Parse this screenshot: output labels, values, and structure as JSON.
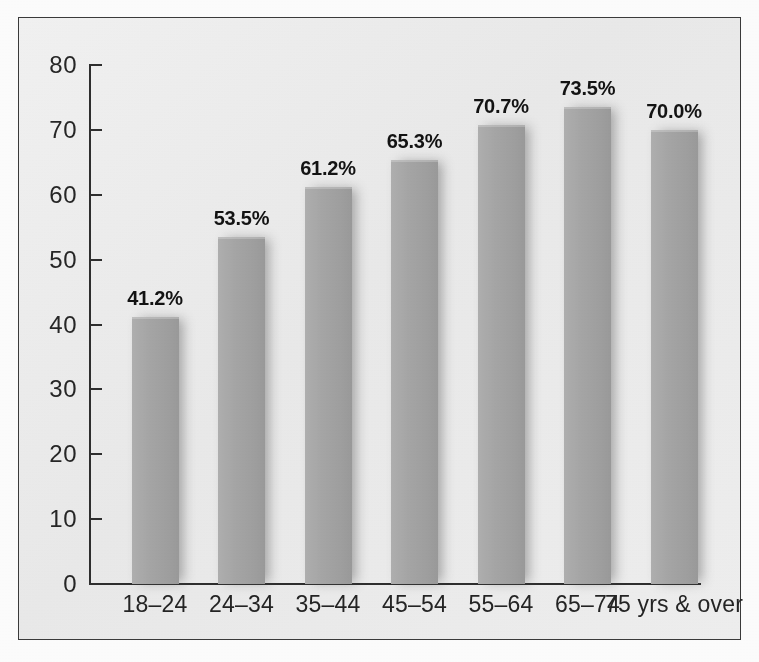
{
  "chart_data": {
    "type": "bar",
    "title": "",
    "subtitle": "",
    "xlabel": "",
    "ylabel": "",
    "categories": [
      "18–24",
      "24–34",
      "35–44",
      "45–54",
      "55–64",
      "65–74",
      "75 yrs & over"
    ],
    "values": [
      41.2,
      53.5,
      61.2,
      65.3,
      70.7,
      73.5,
      70.0
    ],
    "data_labels": [
      "41.2%",
      "53.5%",
      "61.2%",
      "65.3%",
      "70.7%",
      "73.5%",
      "70.0%"
    ],
    "ylim": [
      0,
      80
    ],
    "ytick_labels": [
      "80",
      "70",
      "60",
      "50",
      "40",
      "30",
      "20",
      "10",
      "0"
    ],
    "ytick_values": [
      80,
      70,
      60,
      50,
      40,
      30,
      20,
      10,
      0
    ],
    "grid": false,
    "legend": null,
    "legend_position": "none",
    "bar_color": "#a6a6a6",
    "panel_background": "#eeeeee",
    "frame_color": "#3a3a3a",
    "axis_color": "#2e2e2e",
    "text_color": "#262626"
  }
}
